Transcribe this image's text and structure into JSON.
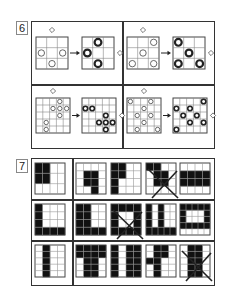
{
  "problem6": {
    "number": "6",
    "quadrants": [
      {
        "grid_size": 3,
        "before_circles": [
          [
            1,
            0
          ],
          [
            1,
            2
          ],
          [
            2,
            1
          ]
        ],
        "after_circles": [
          [
            0,
            1
          ],
          [
            1,
            0
          ],
          [
            2,
            1
          ]
        ],
        "diamond_top": true,
        "diamond_right": true
      },
      {
        "grid_size": 3,
        "before_circles": [
          [
            0,
            2
          ],
          [
            1,
            1
          ],
          [
            2,
            0
          ],
          [
            2,
            2
          ]
        ],
        "after_circles": [
          [
            0,
            0
          ],
          [
            1,
            1
          ],
          [
            2,
            0
          ],
          [
            2,
            2
          ]
        ],
        "diamond_top": true,
        "diamond_right": true
      },
      {
        "grid_size": 5,
        "before_circles": [
          [
            0,
            3
          ],
          [
            1,
            2
          ],
          [
            1,
            3
          ],
          [
            1,
            4
          ],
          [
            2,
            3
          ],
          [
            3,
            1
          ],
          [
            4,
            1
          ]
        ],
        "after_circles": [
          [
            1,
            0
          ],
          [
            1,
            1
          ],
          [
            2,
            3
          ],
          [
            3,
            2
          ],
          [
            3,
            3
          ],
          [
            3,
            4
          ],
          [
            4,
            3
          ]
        ],
        "diamond_top": true,
        "diamond_right": true
      },
      {
        "grid_size": 5,
        "before_circles": [
          [
            0,
            0
          ],
          [
            0,
            3
          ],
          [
            1,
            2
          ],
          [
            2,
            1
          ],
          [
            2,
            3
          ],
          [
            3,
            2
          ],
          [
            4,
            1
          ],
          [
            4,
            4
          ]
        ],
        "after_circles": [
          [
            0,
            4
          ],
          [
            1,
            0
          ],
          [
            1,
            2
          ],
          [
            2,
            1
          ],
          [
            2,
            3
          ],
          [
            3,
            2
          ],
          [
            3,
            4
          ],
          [
            4,
            0
          ]
        ],
        "diamond_top": true,
        "diamond_right": true
      }
    ]
  },
  "problem7": {
    "number": "7",
    "rows": [
      [
        {
          "cols": 4,
          "rows": 3,
          "filled": [
            [
              0,
              0
            ],
            [
              0,
              1
            ],
            [
              1,
              0
            ],
            [
              1,
              1
            ]
          ],
          "crossed": false
        },
        {
          "cols": 4,
          "rows": 4,
          "filled": [
            [
              1,
              1
            ],
            [
              1,
              2
            ],
            [
              2,
              1
            ],
            [
              2,
              2
            ],
            [
              3,
              2
            ]
          ],
          "crossed": false
        },
        {
          "cols": 4,
          "rows": 4,
          "filled": [
            [
              0,
              0
            ],
            [
              0,
              1
            ],
            [
              1,
              0
            ],
            [
              1,
              1
            ],
            [
              2,
              0
            ],
            [
              3,
              0
            ]
          ],
          "crossed": false
        },
        {
          "cols": 4,
          "rows": 4,
          "filled": [
            [
              0,
              0
            ],
            [
              0,
              1
            ],
            [
              1,
              1
            ],
            [
              1,
              2
            ],
            [
              2,
              1
            ],
            [
              2,
              2
            ]
          ],
          "crossed": true
        },
        {
          "cols": 4,
          "rows": 4,
          "filled": [
            [
              1,
              0
            ],
            [
              1,
              1
            ],
            [
              1,
              2
            ],
            [
              1,
              3
            ],
            [
              2,
              0
            ],
            [
              2,
              1
            ],
            [
              2,
              2
            ],
            [
              2,
              3
            ]
          ],
          "crossed": false
        }
      ],
      [
        {
          "cols": 4,
          "rows": 4,
          "filled": [
            [
              0,
              0
            ],
            [
              1,
              0
            ],
            [
              2,
              0
            ],
            [
              3,
              0
            ],
            [
              3,
              1
            ],
            [
              3,
              2
            ],
            [
              3,
              3
            ]
          ],
          "crossed": false
        },
        {
          "cols": 4,
          "rows": 4,
          "filled": [
            [
              0,
              0
            ],
            [
              0,
              1
            ],
            [
              1,
              0
            ],
            [
              1,
              1
            ],
            [
              2,
              0
            ],
            [
              2,
              1
            ],
            [
              3,
              0
            ],
            [
              3,
              1
            ],
            [
              3,
              2
            ],
            [
              3,
              3
            ]
          ],
          "crossed": false
        },
        {
          "cols": 4,
          "rows": 4,
          "filled": [
            [
              0,
              0
            ],
            [
              0,
              1
            ],
            [
              0,
              2
            ],
            [
              0,
              3
            ],
            [
              1,
              0
            ],
            [
              1,
              3
            ],
            [
              2,
              0
            ],
            [
              2,
              3
            ],
            [
              3,
              0
            ],
            [
              3,
              1
            ],
            [
              3,
              2
            ],
            [
              3,
              3
            ]
          ],
          "crossed": true
        },
        {
          "cols": 5,
          "rows": 4,
          "filled": [
            [
              0,
              0
            ],
            [
              1,
              0
            ],
            [
              2,
              0
            ],
            [
              3,
              0
            ],
            [
              0,
              2
            ],
            [
              1,
              2
            ],
            [
              2,
              2
            ],
            [
              3,
              2
            ],
            [
              3,
              1
            ],
            [
              3,
              3
            ],
            [
              3,
              4
            ]
          ],
          "crossed": false
        },
        {
          "cols": 5,
          "rows": 5,
          "filled": [
            [
              0,
              0
            ],
            [
              0,
              1
            ],
            [
              0,
              2
            ],
            [
              0,
              3
            ],
            [
              0,
              4
            ],
            [
              1,
              0
            ],
            [
              1,
              4
            ],
            [
              2,
              0
            ],
            [
              2,
              4
            ],
            [
              3,
              0
            ],
            [
              3,
              1
            ],
            [
              3,
              2
            ],
            [
              3,
              3
            ],
            [
              3,
              4
            ]
          ],
          "crossed": false
        }
      ],
      [
        {
          "cols": 4,
          "rows": 5,
          "filled": [
            [
              0,
              1
            ],
            [
              1,
              1
            ],
            [
              2,
              1
            ],
            [
              3,
              1
            ],
            [
              4,
              1
            ]
          ],
          "crossed": false
        },
        {
          "cols": 4,
          "rows": 5,
          "filled": [
            [
              0,
              0
            ],
            [
              0,
              1
            ],
            [
              0,
              2
            ],
            [
              0,
              3
            ],
            [
              1,
              0
            ],
            [
              1,
              1
            ],
            [
              1,
              2
            ],
            [
              1,
              3
            ],
            [
              2,
              1
            ],
            [
              2,
              2
            ],
            [
              3,
              1
            ],
            [
              3,
              2
            ],
            [
              4,
              1
            ],
            [
              4,
              2
            ]
          ],
          "crossed": false
        },
        {
          "cols": 4,
          "rows": 5,
          "filled": [
            [
              0,
              0
            ],
            [
              1,
              0
            ],
            [
              2,
              0
            ],
            [
              3,
              0
            ],
            [
              4,
              0
            ],
            [
              0,
              2
            ],
            [
              1,
              2
            ],
            [
              2,
              2
            ],
            [
              3,
              2
            ],
            [
              4,
              2
            ],
            [
              0,
              3
            ],
            [
              1,
              3
            ],
            [
              2,
              3
            ],
            [
              3,
              3
            ],
            [
              4,
              3
            ]
          ],
          "crossed": false
        },
        {
          "cols": 4,
          "rows": 5,
          "filled": [
            [
              0,
              1
            ],
            [
              0,
              2
            ],
            [
              1,
              1
            ],
            [
              1,
              2
            ],
            [
              2,
              0
            ],
            [
              2,
              1
            ],
            [
              3,
              1
            ],
            [
              4,
              1
            ]
          ],
          "crossed": false
        },
        {
          "cols": 4,
          "rows": 5,
          "filled": [
            [
              0,
              1
            ],
            [
              0,
              2
            ],
            [
              1,
              1
            ],
            [
              1,
              2
            ],
            [
              2,
              1
            ],
            [
              2,
              2
            ],
            [
              3,
              1
            ],
            [
              3,
              2
            ],
            [
              4,
              1
            ],
            [
              4,
              2
            ]
          ],
          "crossed": true
        }
      ]
    ]
  }
}
